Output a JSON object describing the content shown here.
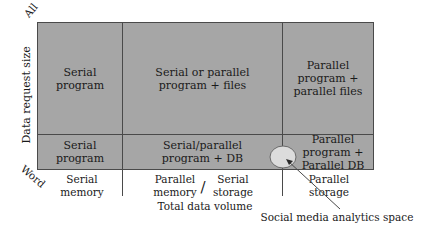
{
  "axes": {
    "y_label": "Data request size",
    "y_top": "All",
    "y_bottom": "Word",
    "x_label": "Total data volume",
    "x_ticks": [
      {
        "line1": "Serial",
        "line2": "memory"
      },
      {
        "line1": "Parallel",
        "line2": "memory"
      },
      {
        "line1": "Serial",
        "line2": "storage"
      },
      {
        "line1": "Parallel",
        "line2": "storage"
      }
    ],
    "x_tick_separator": "/"
  },
  "cells": {
    "top_left": "Serial program",
    "top_middle": "Serial or parallel program + files",
    "top_right": "Parallel program + parallel files",
    "bottom_left": "Serial program",
    "bottom_middle": "Serial/parallel program + DB",
    "bottom_right": "Parallel program + Parallel DB"
  },
  "annotation": {
    "label": "Social media analytics space"
  },
  "colors": {
    "cell_fill": "#a6a6a6",
    "grid_line": "#4a4a4a",
    "ellipse_fill": "#dcdcdc",
    "text": "#1a1a1a"
  }
}
